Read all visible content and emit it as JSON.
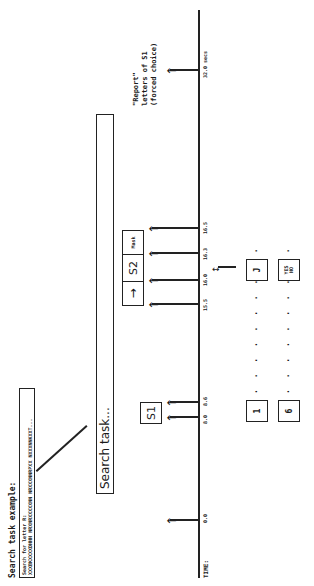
{
  "example": {
    "title": "Search task example:",
    "line1": "Search for letter R:",
    "line2": "XXXBKXXXXDNNN NRXNRXXXXXNN NRXXXNNRPXX NXXXNNKXXT..."
  },
  "search_task": {
    "label": "Search task..."
  },
  "stimuli": {
    "s1": "S1",
    "arrow_cue": "→",
    "s2": "S2",
    "mask": "Mask"
  },
  "responses": {
    "row1": {
      "first": "1",
      "dots": ". . . . . . . . . .",
      "last": "J"
    },
    "row2": {
      "first": "6",
      "dots": ". . . . . . . . . .",
      "last": "YES NO"
    }
  },
  "report": {
    "line1": "\"Report\"",
    "line2": "letters of S1",
    "line3": "(forced choice)"
  },
  "timeline": {
    "label": "TIME:",
    "ticks": [
      "0.0",
      "8.0",
      "8.6",
      "15.5",
      "16.0",
      "16.3",
      "16.5",
      "32.0 secs"
    ]
  }
}
